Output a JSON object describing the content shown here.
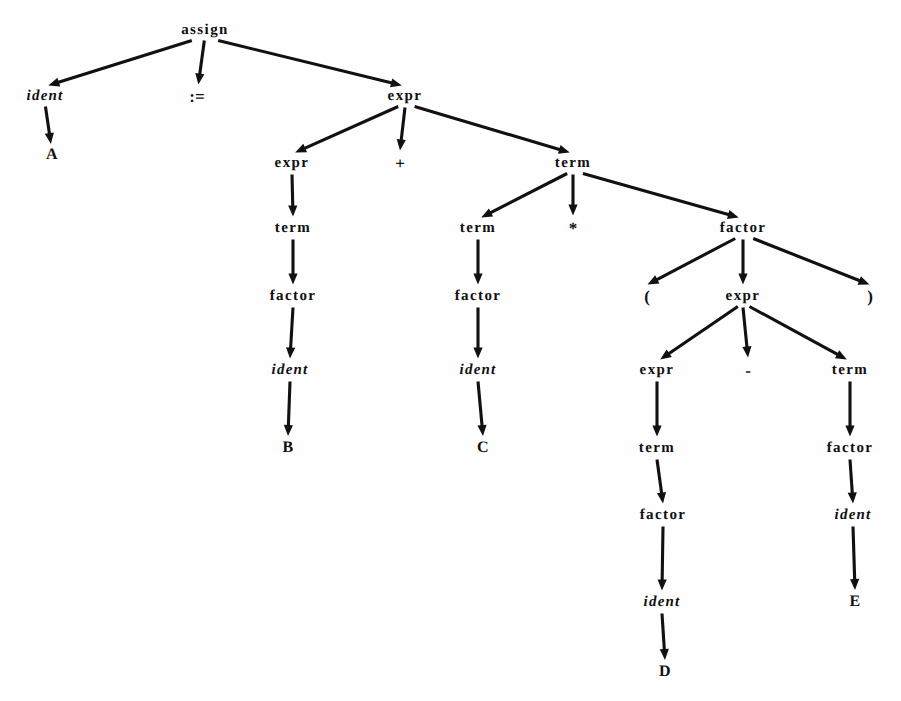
{
  "figure": {
    "kind": "parse-tree",
    "width": 901,
    "height": 701,
    "background_color": "#fefefe",
    "ink_color": "#111111"
  },
  "nodes": [
    {
      "id": "n0",
      "label": "assign",
      "kind": "nonterminal",
      "x": 205,
      "y": 30
    },
    {
      "id": "n1",
      "label": "ident",
      "kind": "terminal",
      "x": 45,
      "y": 96
    },
    {
      "id": "n2",
      "label": ":=",
      "kind": "symbol",
      "x": 197,
      "y": 96
    },
    {
      "id": "n3",
      "label": "expr",
      "kind": "nonterminal",
      "x": 405,
      "y": 96
    },
    {
      "id": "n4",
      "label": "A",
      "kind": "literal",
      "x": 52,
      "y": 155
    },
    {
      "id": "n5",
      "label": "expr",
      "kind": "nonterminal",
      "x": 292,
      "y": 163
    },
    {
      "id": "n6",
      "label": "+",
      "kind": "symbol",
      "x": 400,
      "y": 163
    },
    {
      "id": "n7",
      "label": "term",
      "kind": "nonterminal",
      "x": 573,
      "y": 163
    },
    {
      "id": "n8",
      "label": "term",
      "kind": "nonterminal",
      "x": 293,
      "y": 228
    },
    {
      "id": "n9",
      "label": "term",
      "kind": "nonterminal",
      "x": 478,
      "y": 228
    },
    {
      "id": "n10",
      "label": "*",
      "kind": "symbol",
      "x": 573,
      "y": 228
    },
    {
      "id": "n11",
      "label": "factor",
      "kind": "nonterminal",
      "x": 743,
      "y": 228
    },
    {
      "id": "n12",
      "label": "factor",
      "kind": "nonterminal",
      "x": 293,
      "y": 296
    },
    {
      "id": "n13",
      "label": "factor",
      "kind": "nonterminal",
      "x": 478,
      "y": 296
    },
    {
      "id": "n14",
      "label": "(",
      "kind": "symbol",
      "x": 647,
      "y": 296
    },
    {
      "id": "n15",
      "label": "expr",
      "kind": "nonterminal",
      "x": 743,
      "y": 296
    },
    {
      "id": "n16",
      "label": ")",
      "kind": "symbol",
      "x": 870,
      "y": 296
    },
    {
      "id": "n17",
      "label": "ident",
      "kind": "terminal",
      "x": 290,
      "y": 370
    },
    {
      "id": "n18",
      "label": "ident",
      "kind": "terminal",
      "x": 478,
      "y": 370
    },
    {
      "id": "n19",
      "label": "expr",
      "kind": "nonterminal",
      "x": 657,
      "y": 370
    },
    {
      "id": "n20",
      "label": "-",
      "kind": "symbol",
      "x": 748,
      "y": 370
    },
    {
      "id": "n21",
      "label": "term",
      "kind": "nonterminal",
      "x": 850,
      "y": 370
    },
    {
      "id": "n22",
      "label": "B",
      "kind": "literal",
      "x": 288,
      "y": 448
    },
    {
      "id": "n23",
      "label": "C",
      "kind": "literal",
      "x": 483,
      "y": 448
    },
    {
      "id": "n24",
      "label": "term",
      "kind": "nonterminal",
      "x": 657,
      "y": 448
    },
    {
      "id": "n25",
      "label": "factor",
      "kind": "nonterminal",
      "x": 850,
      "y": 448
    },
    {
      "id": "n26",
      "label": "factor",
      "kind": "nonterminal",
      "x": 663,
      "y": 515
    },
    {
      "id": "n27",
      "label": "ident",
      "kind": "terminal",
      "x": 853,
      "y": 515
    },
    {
      "id": "n28",
      "label": "ident",
      "kind": "terminal",
      "x": 662,
      "y": 602
    },
    {
      "id": "n29",
      "label": "E",
      "kind": "literal",
      "x": 855,
      "y": 602
    },
    {
      "id": "n30",
      "label": "D",
      "kind": "literal",
      "x": 665,
      "y": 672
    }
  ],
  "edges": [
    {
      "from": "n0",
      "to": "n1"
    },
    {
      "from": "n0",
      "to": "n2"
    },
    {
      "from": "n0",
      "to": "n3"
    },
    {
      "from": "n1",
      "to": "n4"
    },
    {
      "from": "n3",
      "to": "n5"
    },
    {
      "from": "n3",
      "to": "n6"
    },
    {
      "from": "n3",
      "to": "n7"
    },
    {
      "from": "n5",
      "to": "n8"
    },
    {
      "from": "n7",
      "to": "n9"
    },
    {
      "from": "n7",
      "to": "n10"
    },
    {
      "from": "n7",
      "to": "n11"
    },
    {
      "from": "n8",
      "to": "n12"
    },
    {
      "from": "n9",
      "to": "n13"
    },
    {
      "from": "n11",
      "to": "n14"
    },
    {
      "from": "n11",
      "to": "n15"
    },
    {
      "from": "n11",
      "to": "n16"
    },
    {
      "from": "n12",
      "to": "n17"
    },
    {
      "from": "n13",
      "to": "n18"
    },
    {
      "from": "n15",
      "to": "n19"
    },
    {
      "from": "n15",
      "to": "n20"
    },
    {
      "from": "n15",
      "to": "n21"
    },
    {
      "from": "n17",
      "to": "n22"
    },
    {
      "from": "n18",
      "to": "n23"
    },
    {
      "from": "n19",
      "to": "n24"
    },
    {
      "from": "n21",
      "to": "n25"
    },
    {
      "from": "n24",
      "to": "n26"
    },
    {
      "from": "n25",
      "to": "n27"
    },
    {
      "from": "n26",
      "to": "n28"
    },
    {
      "from": "n27",
      "to": "n29"
    },
    {
      "from": "n28",
      "to": "n30"
    }
  ]
}
